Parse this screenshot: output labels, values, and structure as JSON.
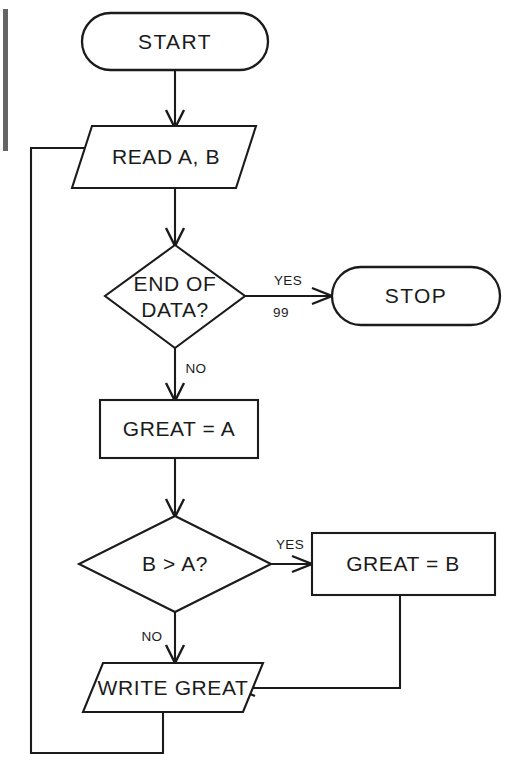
{
  "diagram": {
    "type": "flowchart",
    "stroke_color": "#1b1b1b",
    "background_color": "#ffffff",
    "nodes": [
      {
        "id": "start",
        "shape": "terminal",
        "label": "START"
      },
      {
        "id": "read",
        "shape": "parallelogram",
        "label": "READ A, B"
      },
      {
        "id": "end_of_data",
        "shape": "diamond",
        "label_line1": "END OF",
        "label_line2": "DATA?"
      },
      {
        "id": "stop",
        "shape": "terminal",
        "label": "STOP"
      },
      {
        "id": "great_a",
        "shape": "process",
        "label": "GREAT  =  A"
      },
      {
        "id": "b_gt_a",
        "shape": "diamond",
        "label": "B  >  A?"
      },
      {
        "id": "great_b",
        "shape": "process",
        "label": "GREAT  =  B"
      },
      {
        "id": "write",
        "shape": "parallelogram",
        "label": "WRITE GREAT"
      }
    ],
    "edge_labels": {
      "end_of_data_yes": "YES",
      "end_of_data_yes_code": "99",
      "end_of_data_no": "NO",
      "b_gt_a_yes": "YES",
      "b_gt_a_no": "NO"
    }
  }
}
